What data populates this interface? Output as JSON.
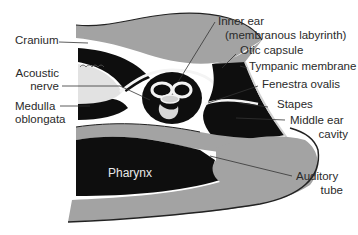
{
  "diagram": {
    "colors": {
      "bone_gray": "#a3a3a3",
      "cavity_black": "#0e0e0e",
      "fluid_white": "#f4f4f4",
      "line": "#333333",
      "text": "#2a2a2a"
    },
    "labels": {
      "cranium": "Cranium",
      "acoustic_nerve_1": "Acoustic",
      "acoustic_nerve_2": "nerve",
      "medulla_1": "Medulla",
      "medulla_2": "oblongata",
      "inner_ear_1": "Inner ear",
      "inner_ear_2": "(membranous labyrinth)",
      "otic_capsule": "Otic capsule",
      "tympanic_membrane": "Tympanic membrane",
      "fenestra_ovalis": "Fenestra ovalis",
      "stapes": "Stapes",
      "middle_ear_1": "Middle ear",
      "middle_ear_2": "cavity",
      "pharynx": "Pharynx",
      "auditory_tube_1": "Auditory",
      "auditory_tube_2": "tube"
    }
  }
}
